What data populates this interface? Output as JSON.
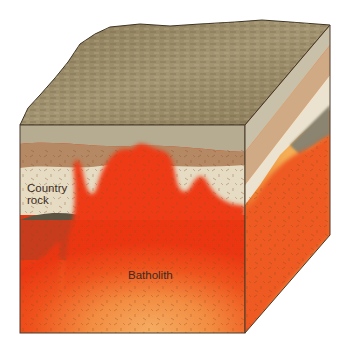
{
  "diagram": {
    "type": "geologic-block-diagram",
    "labels": {
      "country_rock": "Country\nrock",
      "country_rock_line1": "Country",
      "country_rock_line2": "rock",
      "batholith": "Batholith"
    },
    "colors": {
      "background": "#ffffff",
      "surface_top": "#9c8c68",
      "surface_top_dark": "#6e6040",
      "layer_top_gray": "#b6ac92",
      "layer_tan": "#b48964",
      "layer_cream": "#e6dcc4",
      "layer_dark": "#5c5442",
      "magma_red": "#ee3a12",
      "magma_orange": "#f07a30",
      "magma_yellow": "#f6c466",
      "crystal_marks": "#8a4a22",
      "outline": "#4a3a2a"
    }
  }
}
